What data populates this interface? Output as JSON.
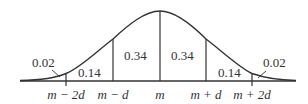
{
  "diagram": {
    "type": "normal-distribution",
    "colors": {
      "stroke": "#333333",
      "background": "#ffffff"
    },
    "axis_labels": [
      "m − 2d",
      "m − d",
      "m",
      "m + d",
      "m + 2d"
    ],
    "region_labels": {
      "left_tail": "0.02",
      "left_outer": "0.14",
      "left_inner": "0.34",
      "right_inner": "0.34",
      "right_outer": "0.14",
      "right_tail": "0.02"
    }
  }
}
